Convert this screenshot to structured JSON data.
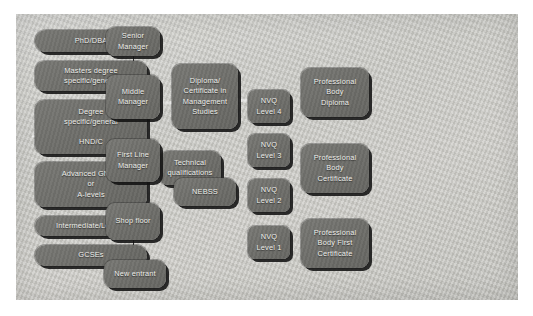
{
  "diagram": {
    "panel": {
      "background_color": "#c9c9c4",
      "box_color": "#6e6e6a",
      "text_color": "#eeeeea",
      "shadow_color": "#121212"
    },
    "columns": [
      {
        "name": "qualifications-academic",
        "nodes": [
          {
            "id": "phd-dba",
            "label": "PhD/DBA"
          },
          {
            "id": "masters-degree",
            "label": "Masters degree\nspecific/general"
          },
          {
            "id": "degree-hnd",
            "label": "Degree\nspecific/general\n\nHND/C"
          },
          {
            "id": "advanced-gnvq",
            "label": "Advanced GNVQ\nor\nA-levels"
          },
          {
            "id": "intermediate-level2",
            "label": "Intermediate/Level 2"
          },
          {
            "id": "gcses",
            "label": "GCSEs"
          }
        ]
      },
      {
        "name": "technical",
        "nodes": [
          {
            "id": "technical-qualifications",
            "label": "Technical\nqualifications"
          }
        ]
      },
      {
        "name": "job-roles",
        "nodes": [
          {
            "id": "senior-manager",
            "label": "Senior\nManager"
          },
          {
            "id": "middle-manager",
            "label": "Middle\nManager"
          },
          {
            "id": "first-line-manager",
            "label": "First Line\nManager"
          },
          {
            "id": "shop-floor",
            "label": "Shop floor"
          },
          {
            "id": "new-entrant",
            "label": "New entrant"
          }
        ]
      },
      {
        "name": "management-awards",
        "nodes": [
          {
            "id": "diploma-certificate-management-studies",
            "label": "Diploma/\nCertificate in\nManagement\nStudies"
          },
          {
            "id": "nebss",
            "label": "NEBSS"
          }
        ]
      },
      {
        "name": "nvq-levels",
        "nodes": [
          {
            "id": "nvq-level-4",
            "label": "NVQ\nLevel 4"
          },
          {
            "id": "nvq-level-3",
            "label": "NVQ\nLevel 3"
          },
          {
            "id": "nvq-level-2",
            "label": "NVQ\nLevel 2"
          },
          {
            "id": "nvq-level-1",
            "label": "NVQ\nLevel 1"
          }
        ]
      },
      {
        "name": "professional-body",
        "nodes": [
          {
            "id": "professional-body-diploma",
            "label": "Professional\nBody\nDiploma"
          },
          {
            "id": "professional-body-certificate",
            "label": "Professional\nBody\nCertificate"
          },
          {
            "id": "professional-body-first-certificate",
            "label": "Professional\nBody First\nCertificate"
          }
        ]
      }
    ],
    "connectors": [
      {
        "id": "senior-to-middle",
        "from": "senior-manager",
        "to": "middle-manager"
      },
      {
        "id": "middle-to-firstline",
        "from": "middle-manager",
        "to": "first-line-manager"
      },
      {
        "id": "firstline-to-shop",
        "from": "first-line-manager",
        "to": "shop-floor"
      },
      {
        "id": "shop-to-newentrant",
        "from": "shop-floor",
        "to": "new-entrant"
      }
    ]
  }
}
